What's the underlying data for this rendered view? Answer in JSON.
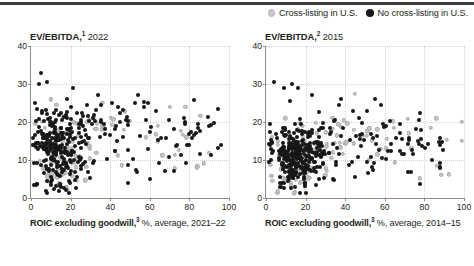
{
  "top_rule_color": "#3c3c3c",
  "legend": {
    "items": [
      {
        "label": "Cross-listing in U.S.",
        "marker": "gray-dot-icon",
        "color": "#c9c9c9"
      },
      {
        "label": "No cross-listing in U.S.",
        "marker": "black-dot-icon",
        "color": "#1a1a1a"
      }
    ]
  },
  "charts": [
    {
      "id": "chart-2022",
      "title_bold": "EV/EBITDA,",
      "title_sup": "1",
      "title_year": "2022",
      "xlabel_bold": "ROIC excluding goodwill,",
      "xlabel_sup": "3",
      "xlabel_rest": "%, average, 2021–22"
    },
    {
      "id": "chart-2015",
      "title_bold": "EV/EBITDA,",
      "title_sup": "2",
      "title_year": "2015",
      "xlabel_bold": "ROIC excluding goodwill,",
      "xlabel_sup": "3",
      "xlabel_rest": "%, average, 2014–15"
    }
  ],
  "chart_data": [
    {
      "type": "scatter",
      "title": "EV/EBITDA,1 2022",
      "xlabel": "ROIC excluding goodwill,3 %, average, 2021–22",
      "ylabel": "EV/EBITDA",
      "xlim": [
        0,
        100
      ],
      "ylim": [
        0,
        40
      ],
      "xticks": [
        0,
        20,
        40,
        60,
        80,
        100
      ],
      "yticks": [
        0,
        10,
        20,
        30,
        40
      ],
      "grid": "dotted",
      "legend_position": "top-right (shared)",
      "series": [
        {
          "name": "No cross-listing in U.S.",
          "color": "#171717",
          "n_points": 330,
          "cluster": {
            "x_center": 13,
            "y_center": 13,
            "x_spread": 11,
            "y_spread": 5.5
          },
          "tail": {
            "x_range": [
              25,
              95
            ],
            "y_range": [
              4,
              26
            ],
            "n": 95
          },
          "outliers": [
            {
              "x": 5,
              "y": 33
            },
            {
              "x": 4,
              "y": 30
            },
            {
              "x": 8,
              "y": 30.5
            },
            {
              "x": 21,
              "y": 29
            },
            {
              "x": 34,
              "y": 27
            },
            {
              "x": 18,
              "y": 26
            },
            {
              "x": 2,
              "y": 25
            },
            {
              "x": 44,
              "y": 24
            },
            {
              "x": 57,
              "y": 24
            },
            {
              "x": 63,
              "y": 23
            },
            {
              "x": 90,
              "y": 19
            },
            {
              "x": 96,
              "y": 14
            },
            {
              "x": 72,
              "y": 7
            },
            {
              "x": 60,
              "y": 5
            },
            {
              "x": 49,
              "y": 4
            }
          ]
        },
        {
          "name": "Cross-listing in U.S.",
          "color": "#c6c6c6",
          "n_points": 120,
          "cluster": {
            "x_center": 14,
            "y_center": 12,
            "x_spread": 10,
            "y_spread": 5
          },
          "tail": {
            "x_range": [
              28,
              90
            ],
            "y_range": [
              5,
              24
            ],
            "n": 40
          },
          "outliers": [
            {
              "x": 10,
              "y": 26
            },
            {
              "x": 36,
              "y": 25
            },
            {
              "x": 70,
              "y": 24
            },
            {
              "x": 78,
              "y": 24
            },
            {
              "x": 64,
              "y": 19
            }
          ]
        }
      ]
    },
    {
      "type": "scatter",
      "title": "EV/EBITDA,2 2015",
      "xlabel": "ROIC excluding goodwill,3 %, average, 2014–15",
      "ylabel": "EV/EBITDA",
      "xlim": [
        0,
        100
      ],
      "ylim": [
        0,
        40
      ],
      "xticks": [
        0,
        20,
        40,
        60,
        80,
        100
      ],
      "yticks": [
        0,
        10,
        20,
        30,
        40
      ],
      "grid": "dotted",
      "legend_position": "top-right (shared)",
      "series": [
        {
          "name": "No cross-listing in U.S.",
          "color": "#171717",
          "n_points": 350,
          "cluster": {
            "x_center": 15,
            "y_center": 11.5,
            "x_spread": 10,
            "y_spread": 4.5
          },
          "tail": {
            "x_range": [
              26,
              90
            ],
            "y_range": [
              4,
              22
            ],
            "n": 100
          },
          "outliers": [
            {
              "x": 4,
              "y": 30.5
            },
            {
              "x": 9,
              "y": 29
            },
            {
              "x": 13,
              "y": 30
            },
            {
              "x": 16,
              "y": 29
            },
            {
              "x": 23,
              "y": 27
            },
            {
              "x": 55,
              "y": 26
            },
            {
              "x": 58,
              "y": 24.5
            },
            {
              "x": 78,
              "y": 22.5
            },
            {
              "x": 38,
              "y": 26
            },
            {
              "x": 47,
              "y": 21
            },
            {
              "x": 88,
              "y": 14
            },
            {
              "x": 34,
              "y": 5
            }
          ]
        },
        {
          "name": "Cross-listing in U.S.",
          "color": "#c6c6c6",
          "n_points": 130,
          "cluster": {
            "x_center": 16,
            "y_center": 10.5,
            "x_spread": 9.5,
            "y_spread": 4.5
          },
          "tail": {
            "x_range": [
              30,
              95
            ],
            "y_range": [
              5,
              22
            ],
            "n": 45
          },
          "outliers": [
            {
              "x": 45,
              "y": 27.5
            },
            {
              "x": 86,
              "y": 21
            },
            {
              "x": 99,
              "y": 20
            },
            {
              "x": 99,
              "y": 15
            },
            {
              "x": 72,
              "y": 17
            }
          ]
        }
      ]
    }
  ]
}
